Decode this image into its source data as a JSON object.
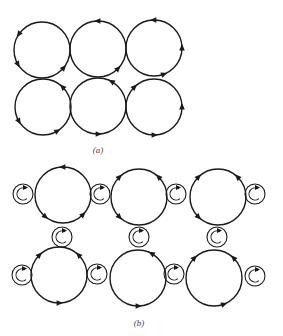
{
  "figure": {
    "panel_a": {
      "label": "(a)",
      "circles": [
        {
          "cx": 42,
          "cy": 50,
          "r": 28,
          "arrows": [
            {
              "deg": 215,
              "dir": "ccw"
            },
            {
              "deg": 150,
              "dir": "ccw"
            },
            {
              "deg": 40,
              "dir": "ccw"
            }
          ]
        },
        {
          "cx": 98,
          "cy": 49,
          "r": 28,
          "arrows": [
            {
              "deg": 270,
              "dir": "ccw"
            },
            {
              "deg": 45,
              "dir": "ccw"
            }
          ]
        },
        {
          "cx": 154,
          "cy": 48,
          "r": 28,
          "arrows": [
            {
              "deg": 270,
              "dir": "ccw"
            },
            {
              "deg": 0,
              "dir": "ccw"
            },
            {
              "deg": 70,
              "dir": "ccw"
            }
          ]
        },
        {
          "cx": 43,
          "cy": 107,
          "r": 28,
          "arrows": [
            {
              "deg": 315,
              "dir": "ccw"
            },
            {
              "deg": 150,
              "dir": "ccw"
            },
            {
              "deg": 60,
              "dir": "ccw"
            }
          ]
        },
        {
          "cx": 98,
          "cy": 106,
          "r": 28,
          "arrows": [
            {
              "deg": 300,
              "dir": "ccw"
            },
            {
              "deg": 90,
              "dir": "ccw"
            }
          ]
        },
        {
          "cx": 154,
          "cy": 107,
          "r": 28,
          "arrows": [
            {
              "deg": 225,
              "dir": "cw"
            },
            {
              "deg": 0,
              "dir": "ccw"
            },
            {
              "deg": 90,
              "dir": "ccw"
            }
          ]
        }
      ]
    },
    "panel_b": {
      "label": "(b)",
      "large_circles": [
        {
          "cx": 63,
          "cy": 195,
          "r": 28,
          "arrows": [
            {
              "deg": 270,
              "dir": "ccw"
            },
            {
              "deg": 130,
              "dir": "ccw"
            },
            {
              "deg": 45,
              "dir": "ccw"
            }
          ]
        },
        {
          "cx": 139,
          "cy": 197,
          "r": 28,
          "arrows": [
            {
              "deg": 225,
              "dir": "cw"
            },
            {
              "deg": 315,
              "dir": "ccw"
            },
            {
              "deg": 135,
              "dir": "ccw"
            }
          ]
        },
        {
          "cx": 218,
          "cy": 197,
          "r": 28,
          "arrows": [
            {
              "deg": 225,
              "dir": "cw"
            },
            {
              "deg": 315,
              "dir": "ccw"
            },
            {
              "deg": 135,
              "dir": "ccw"
            }
          ]
        },
        {
          "cx": 59,
          "cy": 275,
          "r": 28,
          "arrows": [
            {
              "deg": 225,
              "dir": "cw"
            },
            {
              "deg": 315,
              "dir": "ccw"
            },
            {
              "deg": 90,
              "dir": "ccw"
            }
          ]
        },
        {
          "cx": 138,
          "cy": 278,
          "r": 28,
          "arrows": [
            {
              "deg": 300,
              "dir": "ccw"
            },
            {
              "deg": 90,
              "dir": "ccw"
            }
          ]
        },
        {
          "cx": 214,
          "cy": 278,
          "r": 28,
          "arrows": [
            {
              "deg": 225,
              "dir": "cw"
            },
            {
              "deg": 315,
              "dir": "ccw"
            },
            {
              "deg": 70,
              "dir": "ccw"
            }
          ]
        }
      ],
      "small_circles": [
        {
          "cx": 23,
          "cy": 194
        },
        {
          "cx": 100,
          "cy": 194
        },
        {
          "cx": 176,
          "cy": 194
        },
        {
          "cx": 255,
          "cy": 194
        },
        {
          "cx": 62,
          "cy": 237
        },
        {
          "cx": 139,
          "cy": 237
        },
        {
          "cx": 217,
          "cy": 237
        },
        {
          "cx": 22,
          "cy": 275
        },
        {
          "cx": 97,
          "cy": 274
        },
        {
          "cx": 174,
          "cy": 274
        },
        {
          "cx": 255,
          "cy": 276
        }
      ]
    }
  }
}
